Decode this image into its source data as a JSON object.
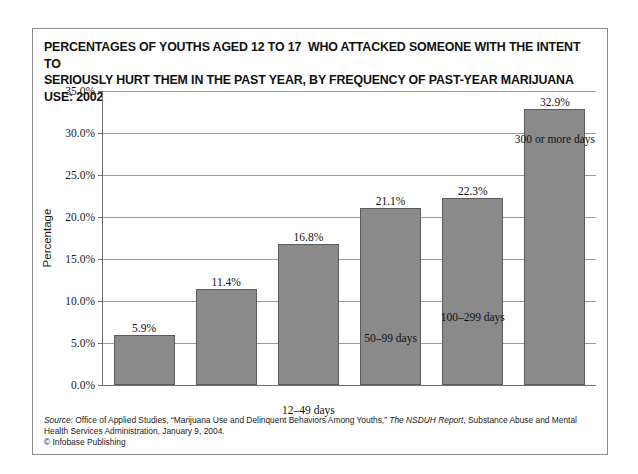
{
  "chart_data": {
    "type": "bar",
    "title": "PERCENTAGES OF YOUTHS AGED 12 TO 17  WHO ATTACKED SOMEONE WITH THE INTENT TO SERIOUSLY HURT THEM IN THE PAST YEAR, BY FREQUENCY OF PAST-YEAR MARIJUANA USE: 2002",
    "title_line1": "PERCENTAGES OF YOUTHS AGED 12 TO 17  WHO ATTACKED SOMEONE WITH THE INTENT TO",
    "title_line2": "SERIOUSLY HURT THEM IN THE PAST YEAR, BY FREQUENCY OF PAST-YEAR MARIJUANA USE: 2002",
    "categories": [
      "No past-year use",
      "1–11 days",
      "12–49 days",
      "50–99 days",
      "100–299 days",
      "300 or more days"
    ],
    "values": [
      5.9,
      11.4,
      16.8,
      21.1,
      22.3,
      32.9
    ],
    "value_labels": [
      "5.9%",
      "11.4%",
      "16.8%",
      "21.1%",
      "22.3%",
      "32.9%"
    ],
    "xlabel": "",
    "ylabel": "Percentage",
    "ylim": [
      0,
      35
    ],
    "ytick_values": [
      0,
      5,
      10,
      15,
      20,
      25,
      30,
      35
    ],
    "ytick_labels": [
      "0.0%",
      "5.0%",
      "10.0%",
      "15.0%",
      "20.0%",
      "25.0%",
      "30.0%",
      "35.0%"
    ],
    "grid": "horizontal",
    "legend": "none",
    "bar_color": "#8a8a8a",
    "bar_border_color": "#5c5c5c",
    "gridline_color": "#9a9a9a",
    "axis_color": "#6e6e6e"
  },
  "source": {
    "label": "Source:",
    "text_part1": " Office of Applied Studies, “Marijuana Use and Delinquent Behaviors Among Youths,” ",
    "report_title": "The NSDUH Report",
    "text_part2": ", Substance Abuse and Mental Health Services Administration, January 9, 2004.",
    "copyright": "© Infobase Publishing"
  }
}
